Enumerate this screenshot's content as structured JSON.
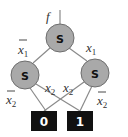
{
  "diagram": {
    "type": "binary decision diagram",
    "root_label": "f",
    "nodes": [
      {
        "id": "top",
        "label": "S"
      },
      {
        "id": "left",
        "label": "S"
      },
      {
        "id": "right",
        "label": "S"
      }
    ],
    "terminals": [
      {
        "id": "t0",
        "label": "0"
      },
      {
        "id": "t1",
        "label": "1"
      }
    ],
    "edges": [
      {
        "from": "top",
        "to": "left",
        "var": "x",
        "sub": "1",
        "negated": true
      },
      {
        "from": "top",
        "to": "right",
        "var": "x",
        "sub": "1",
        "negated": false
      },
      {
        "from": "left",
        "to": "t0",
        "var": "x",
        "sub": "2",
        "negated": true
      },
      {
        "from": "left",
        "to": "t1",
        "var": "x",
        "sub": "2",
        "negated": false
      },
      {
        "from": "right",
        "to": "t0",
        "var": "x",
        "sub": "2",
        "negated": false
      },
      {
        "from": "right",
        "to": "t1",
        "var": "x",
        "sub": "2",
        "negated": true
      }
    ],
    "colors": {
      "node_fill": "#a9a9a9",
      "terminal_fill": "#111111",
      "edge": "#8a8a8a"
    }
  }
}
